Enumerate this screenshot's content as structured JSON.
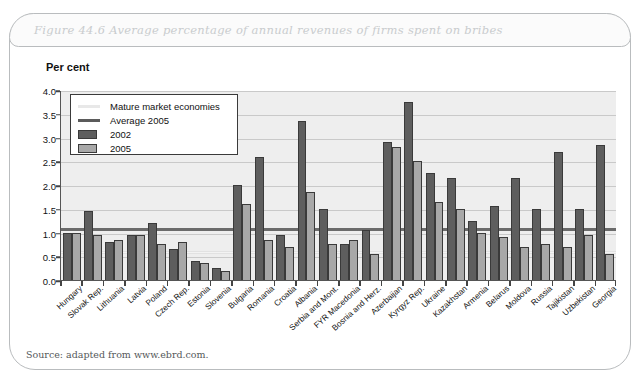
{
  "figure": {
    "title": "Figure 44.6  Average percentage of annual revenues of firms spent on bribes",
    "axis_unit_label": "Per cent",
    "source": "Source: adapted from www.ebrd.com."
  },
  "legend": {
    "items": [
      {
        "label": "Mature market economies",
        "marker": "line",
        "color": "#e8e8e8"
      },
      {
        "label": "Average 2005",
        "marker": "line",
        "color": "#5b5b5b"
      },
      {
        "label": "2002",
        "marker": "box",
        "color": "#5e5e5e"
      },
      {
        "label": "2005",
        "marker": "box",
        "color": "#a8a8a8"
      }
    ]
  },
  "colors": {
    "bar_2002": "#5e5e5e",
    "bar_2005": "#a8a8a8",
    "plot_background": "#eeeeee",
    "gridline": "#c9c9c9",
    "average_line": "#6b6b6b",
    "mature_line": "#f3f3f3",
    "title_text": "#c9ccce"
  },
  "chart_data": {
    "type": "bar",
    "title": "Figure 44.6  Average percentage of annual revenues of firms spent on bribes",
    "xlabel": "",
    "ylabel": "Per cent",
    "ylim": [
      0,
      4.0
    ],
    "ytick_labels": [
      "4.0",
      "3.5",
      "3.0",
      "2.5",
      "2.0",
      "1.5",
      "1.0",
      "0.5",
      "0.0"
    ],
    "ytick_values": [
      4.0,
      3.5,
      3.0,
      2.5,
      2.0,
      1.5,
      1.0,
      0.5,
      0.0
    ],
    "grid": true,
    "legend_position": "upper-left-inside",
    "categories": [
      "Hungary",
      "Slovak Rep.",
      "Lithuania",
      "Latvia",
      "Poland",
      "Czech Rep.",
      "Estonia",
      "Slovenia",
      "Bulgaria",
      "Romania",
      "Croatia",
      "Albania",
      "Serbia and Mont.",
      "FYR Macedonia",
      "Bosnia and Herz.",
      "Azerbaijan",
      "Kyrgyz Rep.",
      "Ukraine",
      "Kazakhstan",
      "Armenia",
      "Belarus",
      "Moldova",
      "Russia",
      "Tajikistan",
      "Uzbekistan",
      "Georgia"
    ],
    "series": [
      {
        "name": "2002",
        "color": "#5e5e5e",
        "values": [
          1.0,
          1.45,
          0.8,
          0.95,
          1.2,
          0.65,
          0.4,
          0.25,
          2.0,
          2.6,
          0.95,
          3.35,
          1.5,
          0.75,
          1.05,
          2.9,
          3.75,
          2.25,
          2.15,
          1.25,
          1.55,
          2.15,
          1.5,
          2.7,
          1.5,
          2.85
        ]
      },
      {
        "name": "2005",
        "color": "#a8a8a8",
        "values": [
          1.0,
          0.95,
          0.85,
          0.95,
          0.75,
          0.8,
          0.35,
          0.2,
          1.6,
          0.85,
          0.7,
          1.85,
          0.75,
          0.85,
          0.55,
          2.8,
          2.5,
          1.65,
          1.5,
          1.0,
          0.9,
          0.7,
          0.75,
          0.7,
          0.95,
          0.55
        ]
      }
    ],
    "reference_lines": [
      {
        "name": "Average 2005",
        "value": 1.08,
        "color": "#6b6b6b"
      },
      {
        "name": "Mature market economies",
        "value": 0.6,
        "color": "#f3f3f3"
      }
    ]
  }
}
